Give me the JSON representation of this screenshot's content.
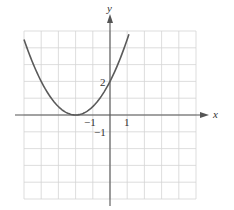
{
  "chart_data": {
    "type": "line",
    "title": "",
    "xlabel": "x",
    "ylabel": "y",
    "xlim": [
      -5,
      5
    ],
    "ylim": [
      -5,
      5
    ],
    "grid": true,
    "legend": null,
    "tick_labels": {
      "x": [
        {
          "value": -1,
          "label": "−1"
        },
        {
          "value": 1,
          "label": "1"
        }
      ],
      "y": [
        {
          "value": 2,
          "label": "2"
        },
        {
          "value": -1,
          "label": "−1"
        }
      ]
    },
    "series": [
      {
        "name": "parabola",
        "equation": "y = 0.5(x + 2)^2",
        "vertex": [
          -2,
          0
        ],
        "y_intercept": 2,
        "x": [
          -5,
          -4.5,
          -4,
          -3.5,
          -3,
          -2.5,
          -2,
          -1.5,
          -1,
          -0.5,
          0,
          0.5,
          1,
          1.1
        ],
        "values": [
          4.5,
          3.125,
          2,
          1.125,
          0.5,
          0.125,
          0,
          0.125,
          0.5,
          1.125,
          2,
          3.125,
          4.5,
          4.805
        ]
      }
    ]
  },
  "colors": {
    "grid": "#d4d4d4",
    "axis": "#555555",
    "curve": "#5a5a5a",
    "text": "#333333"
  },
  "axes": {
    "x_label": "x",
    "y_label": "y"
  },
  "labels": {
    "x_neg1": "−1",
    "x_pos1": "1",
    "y_pos2": "2",
    "y_neg1": "−1"
  }
}
